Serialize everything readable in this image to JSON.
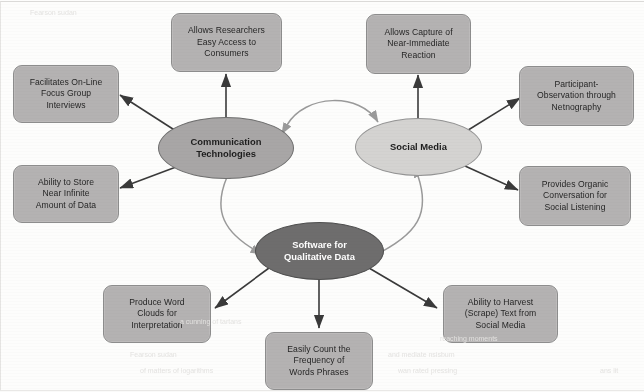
{
  "diagram": {
    "colors": {
      "box_fill": "#b4b2b2",
      "box_border": "#8d8d8d",
      "hub_mid_fill": "#a8a6a6",
      "hub_light_fill": "#d4d3d1",
      "hub_dark_fill": "#6e6d6d",
      "hub_dark_text": "#ffffff",
      "leaf_connector": "#3a3a3a",
      "hub_connector": "#9a9a9a",
      "page_background": "#fdfdfc"
    },
    "hubs": [
      {
        "id": "communication-technologies",
        "label_lines": [
          "Communication",
          "Technologies"
        ],
        "style": "mid"
      },
      {
        "id": "social-media",
        "label_lines": [
          "Social Media"
        ],
        "style": "light"
      },
      {
        "id": "software-for-qualitative-data",
        "label_lines": [
          "Software for",
          "Qualitative Data"
        ],
        "style": "dark"
      }
    ],
    "boxes": [
      {
        "id": "allows-researchers-easy-access",
        "lines": [
          "Allows Researchers",
          "Easy Access to",
          "Consumers"
        ]
      },
      {
        "id": "allows-capture-near-immediate-reaction",
        "lines": [
          "Allows Capture of",
          "Near-Immediate",
          "Reaction"
        ]
      },
      {
        "id": "facilitates-online-focus-group-interviews",
        "lines": [
          "Facilitates On-Line",
          "Focus Group",
          "Interviews"
        ]
      },
      {
        "id": "participant-observation-netnography",
        "lines": [
          "Participant-",
          "Observation through",
          "Netnography"
        ]
      },
      {
        "id": "ability-to-store-near-infinite-data",
        "lines": [
          "Ability to Store",
          "Near Infinite",
          "Amount of Data"
        ]
      },
      {
        "id": "provides-organic-conversation-social-listening",
        "lines": [
          "Provides Organic",
          "Conversation for",
          "Social Listening"
        ]
      },
      {
        "id": "produce-word-clouds-interpretation",
        "lines": [
          "Produce Word",
          "Clouds for",
          "Interpretation"
        ]
      },
      {
        "id": "easily-count-frequency-words-phrases",
        "lines": [
          "Easily Count the",
          "Frequency of",
          "Words Phrases"
        ]
      },
      {
        "id": "ability-to-harvest-scrape-text",
        "lines": [
          "Ability to Harvest",
          "(Scrape) Text from",
          "Social Media"
        ]
      }
    ],
    "connections": [
      {
        "from": "communication-technologies",
        "to": "social-media",
        "arrow": "both",
        "curved": true
      },
      {
        "from": "communication-technologies",
        "to": "software-for-qualitative-data",
        "arrow": "both",
        "curved": true
      },
      {
        "from": "social-media",
        "to": "software-for-qualitative-data",
        "arrow": "both",
        "curved": true
      },
      {
        "from": "communication-technologies",
        "to": "allows-researchers-easy-access",
        "arrow": "to"
      },
      {
        "from": "communication-technologies",
        "to": "facilitates-online-focus-group-interviews",
        "arrow": "to"
      },
      {
        "from": "communication-technologies",
        "to": "ability-to-store-near-infinite-data",
        "arrow": "to"
      },
      {
        "from": "social-media",
        "to": "allows-capture-near-immediate-reaction",
        "arrow": "to"
      },
      {
        "from": "social-media",
        "to": "participant-observation-netnography",
        "arrow": "to"
      },
      {
        "from": "social-media",
        "to": "provides-organic-conversation-social-listening",
        "arrow": "to"
      },
      {
        "from": "software-for-qualitative-data",
        "to": "produce-word-clouds-interpretation",
        "arrow": "to"
      },
      {
        "from": "software-for-qualitative-data",
        "to": "easily-count-frequency-words-phrases",
        "arrow": "to"
      },
      {
        "from": "software-for-qualitative-data",
        "to": "ability-to-harvest-scrape-text",
        "arrow": "to"
      }
    ],
    "ghost_text": {
      "line_a": "a cunning of tartans",
      "line_b": "Fearson  sudan",
      "line_c": "and mediate    nsisbum",
      "line_d": "wan rated   pressing",
      "line_e": "reaching  moments",
      "line_f": "of matters    of logarithms",
      "line_g": "ans lit"
    }
  }
}
